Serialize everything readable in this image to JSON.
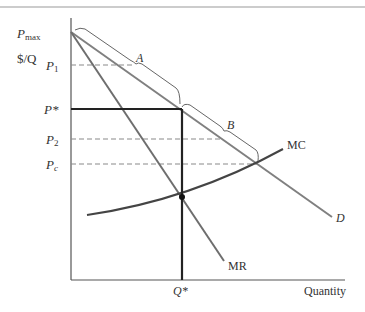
{
  "figure": {
    "y_axis_label": "$/Q",
    "x_axis_label": "Quantity",
    "price_labels": {
      "pmax": {
        "main": "P",
        "sub": "max"
      },
      "p1": {
        "main": "P",
        "sub": "1"
      },
      "pstar": {
        "main": "P*"
      },
      "p2": {
        "main": "P",
        "sub": "2"
      },
      "pc": {
        "main": "P",
        "sub": "c"
      }
    },
    "quantity_labels": {
      "qstar": "Q*"
    },
    "curve_labels": {
      "mc": "MC",
      "mr": "MR",
      "d": "D"
    },
    "bracket_labels": {
      "a": "A",
      "b": "B"
    },
    "colors": {
      "axis": "#555555",
      "curves": "#808080",
      "dark": "#222222",
      "dashed": "#8a8a8a",
      "bracket": "#666666"
    }
  }
}
